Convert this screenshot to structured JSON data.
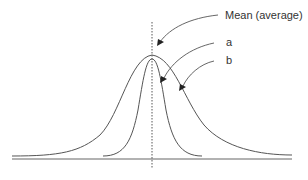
{
  "diagram": {
    "type": "normal-distribution-comparison",
    "labels": {
      "mean": "Mean (average)",
      "curve_a": "a",
      "curve_b": "b"
    },
    "curves": [
      {
        "id": "a",
        "description": "narrow, tall distribution",
        "peak_x": 152
      },
      {
        "id": "b",
        "description": "wide, flatter distribution",
        "peak_x": 152
      }
    ],
    "colors": {
      "line": "#555555",
      "text": "#333333",
      "background": "#ffffff"
    }
  }
}
